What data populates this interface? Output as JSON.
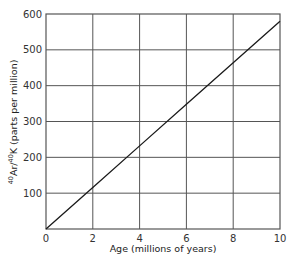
{
  "chart_data": {
    "type": "line",
    "title": "",
    "xlabel": "Age (millions of years)",
    "ylabel": "40Ar/40K (parts per million)",
    "ylabel_parts": {
      "sup1": "40",
      "base1": "Ar/",
      "sup2": "40",
      "base2": "K (parts per million)"
    },
    "xlim": [
      0,
      10
    ],
    "ylim": [
      0,
      600
    ],
    "x_ticks": [
      0,
      2,
      4,
      6,
      8,
      10
    ],
    "y_ticks": [
      100,
      200,
      300,
      400,
      500,
      600
    ],
    "grid": true,
    "legend": null,
    "series": [
      {
        "name": "40Ar/40K ratio",
        "x": [
          0,
          2,
          4,
          6,
          8,
          10
        ],
        "y": [
          0,
          116,
          232,
          348,
          464,
          580
        ]
      }
    ],
    "colors": {
      "line": "#1a1a1a",
      "grid": "#555555",
      "frame": "#555555"
    }
  }
}
